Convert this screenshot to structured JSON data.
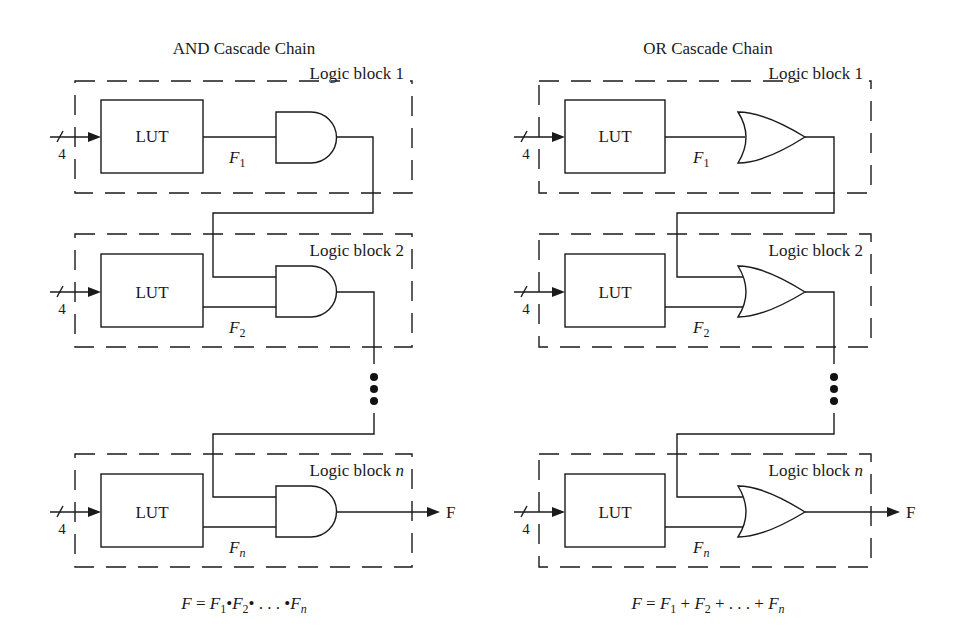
{
  "diagrams": [
    {
      "title": "AND Cascade Chain",
      "gate_type": "AND",
      "blocks": [
        {
          "label_prefix": "Logic block ",
          "label_index": "1",
          "lut": "LUT",
          "input_width": "4",
          "signal": "F",
          "signal_sub": "1"
        },
        {
          "label_prefix": "Logic block ",
          "label_index": "2",
          "lut": "LUT",
          "input_width": "4",
          "signal": "F",
          "signal_sub": "2"
        },
        {
          "label_prefix": "Logic block ",
          "label_index": "n",
          "lut": "LUT",
          "input_width": "4",
          "signal": "F",
          "signal_sub": "n"
        }
      ],
      "output": "F",
      "equation": {
        "lhs": "F",
        "eq": " = ",
        "t1": "F",
        "t1_sub": "1",
        "op1": "•",
        "t2": "F",
        "t2_sub": "2",
        "op2": "• . . . •",
        "tn": "F",
        "tn_sub": "n"
      }
    },
    {
      "title": "OR Cascade Chain",
      "gate_type": "OR",
      "blocks": [
        {
          "label_prefix": "Logic block ",
          "label_index": "1",
          "lut": "LUT",
          "input_width": "4",
          "signal": "F",
          "signal_sub": "1"
        },
        {
          "label_prefix": "Logic block ",
          "label_index": "2",
          "lut": "LUT",
          "input_width": "4",
          "signal": "F",
          "signal_sub": "2"
        },
        {
          "label_prefix": "Logic block ",
          "label_index": "n",
          "lut": "LUT",
          "input_width": "4",
          "signal": "F",
          "signal_sub": "n"
        }
      ],
      "output": "F",
      "equation": {
        "lhs": "F",
        "eq": " = ",
        "t1": "F",
        "t1_sub": "1",
        "op1": " + ",
        "t2": "F",
        "t2_sub": "2",
        "op2": " + . . . + ",
        "tn": "F",
        "tn_sub": "n"
      }
    }
  ]
}
